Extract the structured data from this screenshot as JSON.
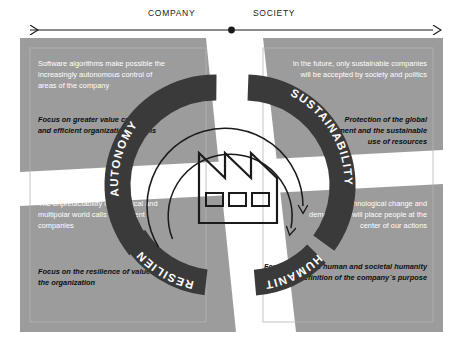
{
  "axis": {
    "left_label": "COMPANY",
    "right_label": "SOCIETY",
    "left_arrow": "arrow-left",
    "right_arrow": "arrow-right",
    "center_dot": "axis-center-dot"
  },
  "colors": {
    "quadrant_fill": "#9c9c9c",
    "band_white": "#ffffff",
    "ring_dark": "#3a3a3a",
    "ring_label": "#ffffff",
    "body_text": "#ffffff",
    "bold_text": "#101010",
    "stroke": "#1a1a1a",
    "page_bg": "#ffffff"
  },
  "center": {
    "icon": "factory-icon",
    "windows": 3,
    "roof_peaks": 3
  },
  "ring": {
    "segments": [
      {
        "id": "autonomy",
        "label": "AUTONOMY",
        "position": "top-left",
        "text_direction": "bottom-to-top"
      },
      {
        "id": "sustainability",
        "label": "SUSTAINABILITY",
        "position": "top-right",
        "text_direction": "top-to-bottom"
      },
      {
        "id": "humanity",
        "label": "HUMANITY",
        "position": "bottom-right",
        "text_direction": "bottom-to-top-inverted"
      },
      {
        "id": "resilience",
        "label": "RESILIENCE",
        "position": "bottom-left",
        "text_direction": "top-to-bottom-inverted"
      }
    ],
    "arrows": [
      {
        "id": "outer-cycle-arrow",
        "direction": "clockwise"
      },
      {
        "id": "inner-cycle-arrow",
        "direction": "clockwise"
      }
    ]
  },
  "quadrants": {
    "top_left": {
      "id": "autonomy",
      "lead": "Software algorithms make possible the increasingly autonomous control of areas of the company",
      "bold": "Focus on greater value creation and efficient organizational forms"
    },
    "top_right": {
      "id": "sustainability",
      "lead": "In the future, only sustainable companies will be accepted by society and politics",
      "bold": "Protection of the global environment and the sustainable use of resources"
    },
    "bottom_left": {
      "id": "resilience",
      "lead": "The unpredictability of a political and multipolar world calls for resilient companies",
      "bold": "Focus on the resilience of value creation and of the organization"
    },
    "bottom_right": {
      "id": "humanity",
      "lead": "Technological change and demography will place people at the center of our actions",
      "bold": "Focusing on the human and societal humanity and the definition of the company´s purpose"
    }
  }
}
